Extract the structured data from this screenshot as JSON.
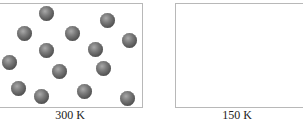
{
  "panels": [
    {
      "label": "300 K",
      "balls": [
        [
          46,
          13
        ],
        [
          107,
          20
        ],
        [
          24,
          33
        ],
        [
          72,
          33
        ],
        [
          129,
          40
        ],
        [
          46,
          50
        ],
        [
          95,
          49
        ],
        [
          9,
          62
        ],
        [
          59,
          71
        ],
        [
          103,
          68
        ],
        [
          18,
          88
        ],
        [
          41,
          96
        ],
        [
          84,
          91
        ],
        [
          127,
          98
        ]
      ]
    },
    {
      "label": "150 K",
      "balls": []
    }
  ],
  "colors": {
    "border": "#b8b8b8",
    "ball": "#5a5a5a"
  }
}
